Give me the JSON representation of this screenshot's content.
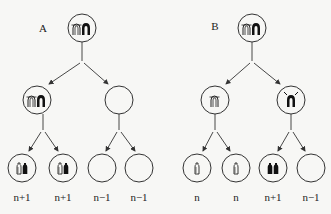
{
  "panels": [
    {
      "id": "A",
      "label": "A",
      "parent": {
        "chromosomes": [
          "open-pair",
          "filled-pair"
        ]
      },
      "meiosis_I": [
        {
          "chromosomes": [
            "open-pair",
            "filled-pair"
          ]
        },
        {
          "chromosomes": []
        }
      ],
      "gametes": [
        {
          "chromosomes": [
            "open-single",
            "filled-single"
          ],
          "ploidy": "n+1"
        },
        {
          "chromosomes": [
            "open-single",
            "filled-single"
          ],
          "ploidy": "n+1"
        },
        {
          "chromosomes": [],
          "ploidy": "n−1"
        },
        {
          "chromosomes": [],
          "ploidy": "n−1"
        }
      ]
    },
    {
      "id": "B",
      "label": "B",
      "parent": {
        "chromosomes": [
          "open-pair",
          "filled-pair"
        ]
      },
      "meiosis_I": [
        {
          "chromosomes": [
            "open-pair"
          ]
        },
        {
          "chromosomes": [
            "filled-pair"
          ]
        }
      ],
      "gametes": [
        {
          "chromosomes": [
            "open-single"
          ],
          "ploidy": "n"
        },
        {
          "chromosomes": [
            "open-single"
          ],
          "ploidy": "n"
        },
        {
          "chromosomes": [
            "filled-single",
            "filled-single"
          ],
          "ploidy": "n+1"
        },
        {
          "chromosomes": [],
          "ploidy": "n−1"
        }
      ]
    }
  ],
  "colors": {
    "line": "#333333",
    "fill_dark": "#111111",
    "background": "#f7f7f5"
  }
}
